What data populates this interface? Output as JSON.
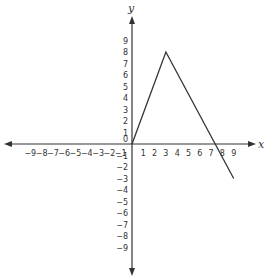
{
  "chart_data": {
    "type": "line",
    "title": "",
    "xlabel": "x",
    "ylabel": "y",
    "xlim": [
      -10,
      10
    ],
    "ylim": [
      -10,
      10
    ],
    "x_ticks": [
      -9,
      -8,
      -7,
      -6,
      -5,
      -4,
      -3,
      -2,
      -1,
      1,
      2,
      3,
      4,
      5,
      6,
      7,
      8,
      9
    ],
    "y_ticks": [
      9,
      8,
      7,
      6,
      5,
      4,
      3,
      2,
      1,
      -1,
      -2,
      -3,
      -4,
      -5,
      -6,
      -7,
      -8,
      -9
    ],
    "origin_label": "0",
    "grid": false,
    "series": [
      {
        "name": "f(x)",
        "points": [
          [
            0,
            0
          ],
          [
            3,
            8
          ],
          [
            9,
            -3
          ]
        ]
      }
    ]
  },
  "colors": {
    "axis": "#333333",
    "line": "#333333",
    "background": "#ffffff"
  }
}
